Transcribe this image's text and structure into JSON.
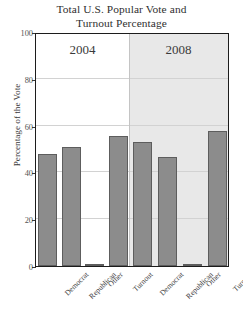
{
  "chart_data": {
    "type": "bar",
    "title": "Total U.S. Popular Vote and Turnout Percentage",
    "title_line1": "Total U.S. Popular Vote and",
    "title_line2": "Turnout Percentage",
    "xlabel": "",
    "ylabel": "Percentage of the Vote",
    "ylim": [
      0,
      100
    ],
    "yticks": [
      0,
      20,
      40,
      60,
      80,
      100
    ],
    "grid": true,
    "legend": "none",
    "panels": [
      {
        "name": "2004",
        "label": "2004",
        "shaded": false,
        "categories": [
          "Democrat",
          "Republican",
          "Other",
          "Turnout"
        ],
        "values": [
          48,
          51,
          1,
          55.5
        ]
      },
      {
        "name": "2008",
        "label": "2008",
        "shaded": true,
        "categories": [
          "Democrat",
          "Republican",
          "Other",
          "Turnout"
        ],
        "values": [
          53,
          46.5,
          1,
          57.5
        ]
      }
    ],
    "bar_color": "#8c8c8c",
    "bar_edge_color": "#5d5d5d",
    "panel_shade_color": "#e8e8e8",
    "frame_color": "#1c1c1c"
  }
}
